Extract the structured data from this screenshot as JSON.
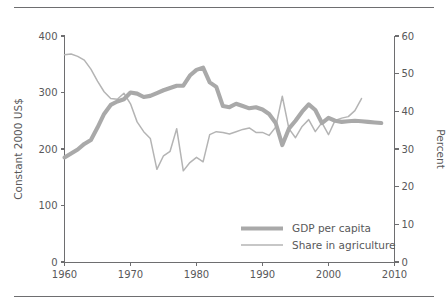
{
  "figure": {
    "has_top_rule": true,
    "has_bottom_rule": true,
    "background_color": "#ffffff"
  },
  "chart_data": {
    "type": "line",
    "title": "",
    "xlabel": "",
    "ylabel": "Constant 2000 US$",
    "y2label": "Percent",
    "xlim": [
      1960,
      2010
    ],
    "ylim": [
      0,
      400
    ],
    "y2lim": [
      0,
      60
    ],
    "grid": false,
    "legend_position": "bottom-right",
    "xticks": [
      1960,
      1970,
      1980,
      1990,
      2000,
      2010
    ],
    "yticks": [
      0,
      100,
      200,
      300,
      400
    ],
    "y2ticks": [
      0,
      10,
      20,
      30,
      40,
      50,
      60
    ],
    "colors": {
      "gdp_per_capita": "#a9a9a9",
      "share_in_agriculture": "#b4b4b4",
      "axis": "#6e6e70",
      "text": "#58585a"
    },
    "series": [
      {
        "name": "GDP per capita",
        "axis": "left",
        "unit": "Constant 2000 US$",
        "x": [
          1960,
          1961,
          1962,
          1963,
          1964,
          1965,
          1966,
          1967,
          1968,
          1969,
          1970,
          1971,
          1972,
          1973,
          1974,
          1975,
          1976,
          1977,
          1978,
          1979,
          1980,
          1981,
          1982,
          1983,
          1984,
          1985,
          1986,
          1987,
          1988,
          1989,
          1990,
          1991,
          1992,
          1993,
          1994,
          1995,
          1996,
          1997,
          1998,
          1999,
          2000,
          2001,
          2002,
          2003,
          2004,
          2005,
          2006,
          2007,
          2008
        ],
        "values": [
          185,
          192,
          199,
          209,
          216,
          238,
          262,
          278,
          284,
          288,
          300,
          298,
          292,
          294,
          299,
          304,
          308,
          312,
          312,
          330,
          340,
          344,
          318,
          310,
          276,
          274,
          280,
          276,
          272,
          274,
          270,
          262,
          246,
          207,
          236,
          250,
          266,
          279,
          269,
          246,
          255,
          250,
          248,
          249,
          250,
          249,
          248,
          247,
          246
        ]
      },
      {
        "name": "Share in agriculture",
        "axis": "right",
        "unit": "Percent",
        "x": [
          1960,
          1961,
          1962,
          1963,
          1964,
          1965,
          1966,
          1967,
          1968,
          1969,
          1970,
          1971,
          1972,
          1973,
          1974,
          1975,
          1976,
          1977,
          1978,
          1979,
          1980,
          1981,
          1982,
          1983,
          1984,
          1985,
          1986,
          1987,
          1988,
          1989,
          1990,
          1991,
          1992,
          1993,
          1994,
          1995,
          1996,
          1997,
          1998,
          1999,
          2000,
          2001,
          2002,
          2003,
          2004,
          2005
        ],
        "values": [
          55.0,
          55.2,
          54.6,
          53.6,
          51.2,
          48.0,
          45.2,
          43.4,
          43.2,
          44.8,
          42.0,
          37.2,
          34.6,
          32.8,
          24.6,
          28.2,
          29.4,
          35.4,
          24.2,
          26.4,
          27.8,
          26.6,
          33.8,
          34.6,
          34.4,
          34.0,
          34.6,
          35.2,
          35.6,
          34.4,
          34.4,
          33.6,
          35.8,
          44.0,
          35.4,
          33.0,
          36.0,
          37.8,
          34.6,
          37.0,
          33.8,
          37.6,
          38.2,
          38.6,
          40.2,
          43.4
        ]
      }
    ]
  },
  "legend": {
    "items": [
      {
        "label": "GDP per capita",
        "color": "#a9a9a9",
        "style": "thick"
      },
      {
        "label": "Share in agriculture",
        "color": "#b4b4b4",
        "style": "thin"
      }
    ]
  },
  "axes": {
    "left": {
      "title": "Constant 2000 US$",
      "tick_labels": [
        "0",
        "100",
        "200",
        "300",
        "400"
      ]
    },
    "right": {
      "title": "Percent",
      "tick_labels": [
        "0",
        "10",
        "20",
        "30",
        "40",
        "50",
        "60"
      ]
    },
    "bottom": {
      "title": "",
      "tick_labels": [
        "1960",
        "1970",
        "1980",
        "1990",
        "2000",
        "2010"
      ]
    }
  }
}
